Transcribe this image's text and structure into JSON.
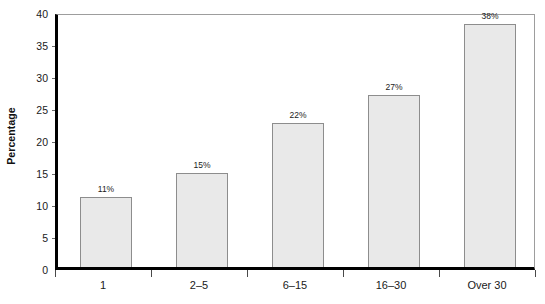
{
  "chart_data": {
    "type": "bar",
    "title": "",
    "xlabel": "",
    "ylabel": "Percentage",
    "categories": [
      "1",
      "2–5",
      "6–15",
      "16–30",
      "Over 30"
    ],
    "values": [
      11,
      15,
      22,
      27,
      38
    ],
    "plotted_values": [
      11.0,
      14.7,
      22.5,
      26.8,
      38.0
    ],
    "data_labels": [
      "11%",
      "15%",
      "22%",
      "27%",
      "38%"
    ],
    "ylim": [
      0,
      40
    ],
    "ytick_step": 5,
    "ytick_labels": [
      "0",
      "5",
      "10",
      "15",
      "20",
      "25",
      "30",
      "35",
      "40"
    ],
    "ytick_values": [
      0,
      5,
      10,
      15,
      20,
      25,
      30,
      35,
      40
    ],
    "grid": false,
    "legend": false,
    "legend_position": "none",
    "colors": {
      "bar_fill": "#e9e9e9",
      "bar_border": "#8d8d8d",
      "axis": "#000000",
      "frame": "#9d9d9d",
      "text": "#1a1a1a",
      "background": "#ffffff"
    }
  },
  "axes": {
    "y_title": "Percentage"
  }
}
